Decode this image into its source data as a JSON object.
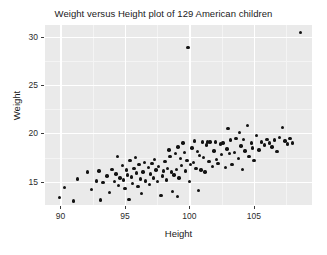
{
  "chart_data": {
    "type": "scatter",
    "title": "Weight versus Height plot of 129 American children",
    "xlabel": "Height",
    "ylabel": "Weight",
    "xlim": [
      88.8,
      109.5
    ],
    "ylim": [
      12.6,
      31.2
    ],
    "xticks": [
      90,
      95,
      100,
      105
    ],
    "yticks": [
      15,
      20,
      25,
      30
    ],
    "grid": true,
    "legend": null,
    "n_points": 129,
    "point_color": "#121212",
    "panel_background": "#eaeaea",
    "gridline_color": "#ffffff",
    "points": [
      [
        89.9,
        13.4
      ],
      [
        90.3,
        14.4
      ],
      [
        91.0,
        13.0
      ],
      [
        91.3,
        15.3
      ],
      [
        92.1,
        16.0
      ],
      [
        92.4,
        14.2
      ],
      [
        92.8,
        15.1
      ],
      [
        93.0,
        16.1
      ],
      [
        93.3,
        14.9
      ],
      [
        93.6,
        15.6
      ],
      [
        93.8,
        13.9
      ],
      [
        94.0,
        16.3
      ],
      [
        94.2,
        15.0
      ],
      [
        94.3,
        15.8
      ],
      [
        94.5,
        14.6
      ],
      [
        94.6,
        15.4
      ],
      [
        94.8,
        16.7
      ],
      [
        94.9,
        15.2
      ],
      [
        95.0,
        14.3
      ],
      [
        95.1,
        16.2
      ],
      [
        95.2,
        15.7
      ],
      [
        95.3,
        13.2
      ],
      [
        95.4,
        17.2
      ],
      [
        95.5,
        15.5
      ],
      [
        95.6,
        14.8
      ],
      [
        95.7,
        16.4
      ],
      [
        95.8,
        17.5
      ],
      [
        95.9,
        15.9
      ],
      [
        96.0,
        14.5
      ],
      [
        96.1,
        16.8
      ],
      [
        96.2,
        15.3
      ],
      [
        96.4,
        16.0
      ],
      [
        96.5,
        17.0
      ],
      [
        96.6,
        15.1
      ],
      [
        96.8,
        16.5
      ],
      [
        96.9,
        14.7
      ],
      [
        97.0,
        15.8
      ],
      [
        97.1,
        16.9
      ],
      [
        97.2,
        15.4
      ],
      [
        97.3,
        17.3
      ],
      [
        97.4,
        16.2
      ],
      [
        97.5,
        15.0
      ],
      [
        97.6,
        16.6
      ],
      [
        97.8,
        13.6
      ],
      [
        97.9,
        15.6
      ],
      [
        98.0,
        16.1
      ],
      [
        98.1,
        17.1
      ],
      [
        98.2,
        15.2
      ],
      [
        98.3,
        16.4
      ],
      [
        98.4,
        18.3
      ],
      [
        98.5,
        17.6
      ],
      [
        98.6,
        16.0
      ],
      [
        98.8,
        15.7
      ],
      [
        98.9,
        17.9
      ],
      [
        99.0,
        16.3
      ],
      [
        99.1,
        18.6
      ],
      [
        99.2,
        15.4
      ],
      [
        99.3,
        17.4
      ],
      [
        99.4,
        16.7
      ],
      [
        99.5,
        19.0
      ],
      [
        99.6,
        18.0
      ],
      [
        99.7,
        16.1
      ],
      [
        99.8,
        17.2
      ],
      [
        99.9,
        28.9
      ],
      [
        100.0,
        15.0
      ],
      [
        100.1,
        16.8
      ],
      [
        100.2,
        18.5
      ],
      [
        100.3,
        17.0
      ],
      [
        100.4,
        19.2
      ],
      [
        100.5,
        16.4
      ],
      [
        100.6,
        18.1
      ],
      [
        100.8,
        17.7
      ],
      [
        100.9,
        16.2
      ],
      [
        101.0,
        19.1
      ],
      [
        101.1,
        17.5
      ],
      [
        101.2,
        16.0
      ],
      [
        101.3,
        18.8
      ],
      [
        101.4,
        19.1
      ],
      [
        101.5,
        17.1
      ],
      [
        101.6,
        19.1
      ],
      [
        101.8,
        16.6
      ],
      [
        101.9,
        18.2
      ],
      [
        102.0,
        19.1
      ],
      [
        102.1,
        17.3
      ],
      [
        102.2,
        16.9
      ],
      [
        102.4,
        18.9
      ],
      [
        102.5,
        17.8
      ],
      [
        102.6,
        19.0
      ],
      [
        102.8,
        16.5
      ],
      [
        102.9,
        18.4
      ],
      [
        103.0,
        20.5
      ],
      [
        103.1,
        17.9
      ],
      [
        103.2,
        19.3
      ],
      [
        103.3,
        16.8
      ],
      [
        103.5,
        18.0
      ],
      [
        103.6,
        19.5
      ],
      [
        103.8,
        17.4
      ],
      [
        103.9,
        20.1
      ],
      [
        104.0,
        18.7
      ],
      [
        104.1,
        16.3
      ],
      [
        104.2,
        19.4
      ],
      [
        104.3,
        18.2
      ],
      [
        104.5,
        20.8
      ],
      [
        104.6,
        17.6
      ],
      [
        104.8,
        19.0
      ],
      [
        104.9,
        18.5
      ],
      [
        105.0,
        17.2
      ],
      [
        105.2,
        19.8
      ],
      [
        105.4,
        18.3
      ],
      [
        105.6,
        19.1
      ],
      [
        105.8,
        18.8
      ],
      [
        106.0,
        19.4
      ],
      [
        106.2,
        19.0
      ],
      [
        106.4,
        18.6
      ],
      [
        106.6,
        19.3
      ],
      [
        106.8,
        18.1
      ],
      [
        107.0,
        19.6
      ],
      [
        107.2,
        20.6
      ],
      [
        107.4,
        19.2
      ],
      [
        107.6,
        18.9
      ],
      [
        107.8,
        19.5
      ],
      [
        108.0,
        19.0
      ],
      [
        108.6,
        30.4
      ],
      [
        98.7,
        14.0
      ],
      [
        96.3,
        13.8
      ],
      [
        99.05,
        13.5
      ],
      [
        93.1,
        13.1
      ],
      [
        100.7,
        14.1
      ],
      [
        94.4,
        17.6
      ]
    ]
  }
}
